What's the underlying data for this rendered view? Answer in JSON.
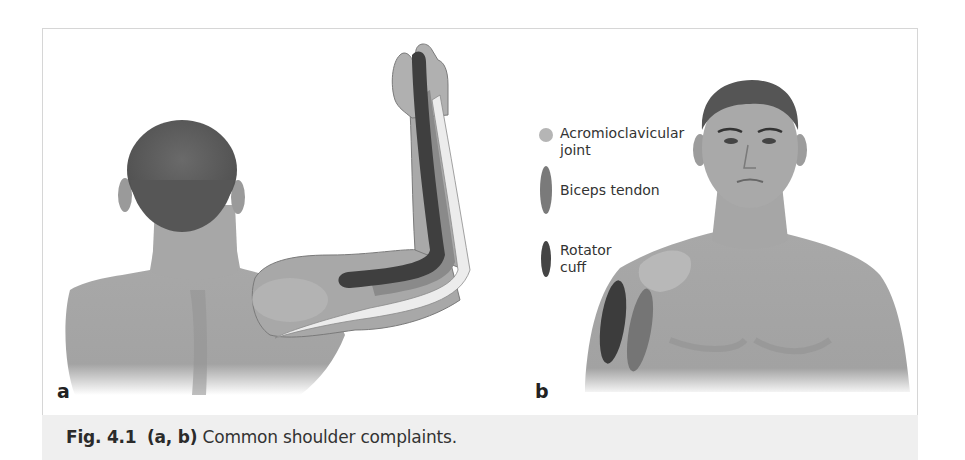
{
  "figure": {
    "number": "Fig. 4.1",
    "parts": "(a, b)",
    "caption_text": "Common shoulder complaints.",
    "panels": [
      {
        "label": "a",
        "view": "posterior view, arm raised"
      },
      {
        "label": "b",
        "view": "anterior view"
      }
    ],
    "legend": [
      {
        "label_line1": "Acromioclavicular",
        "label_line2": "joint",
        "shape": "circle",
        "color": "#b5b5b5"
      },
      {
        "label_line1": "Biceps tendon",
        "label_line2": "",
        "shape": "ellipse",
        "color": "#7a7a7a"
      },
      {
        "label_line1": "Rotator",
        "label_line2": "cuff",
        "shape": "ellipse",
        "color": "#444444"
      }
    ]
  }
}
